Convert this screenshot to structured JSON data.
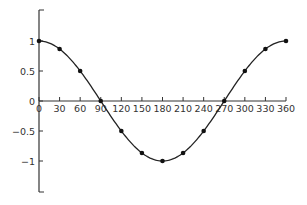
{
  "chart_data": {
    "type": "line",
    "title": "",
    "xlabel": "",
    "ylabel": "",
    "series": [
      {
        "name": "cos(x)",
        "x": [
          0,
          30,
          60,
          90,
          120,
          150,
          180,
          210,
          240,
          270,
          300,
          330,
          360
        ],
        "values": [
          1,
          0.866,
          0.5,
          0,
          -0.5,
          -0.866,
          -1,
          -0.866,
          -0.5,
          0,
          0.5,
          0.866,
          1
        ]
      }
    ],
    "x_ticks": [
      "0",
      "30",
      "60",
      "90",
      "120",
      "150",
      "180",
      "210",
      "240",
      "270",
      "300",
      "330",
      "360"
    ],
    "y_ticks": [
      "1",
      "0.5",
      "0",
      "−0.5",
      "−1"
    ],
    "xlim": [
      0,
      360
    ],
    "ylim": [
      -1.5,
      1.5
    ],
    "grid": false,
    "legend": null,
    "markers": true
  }
}
